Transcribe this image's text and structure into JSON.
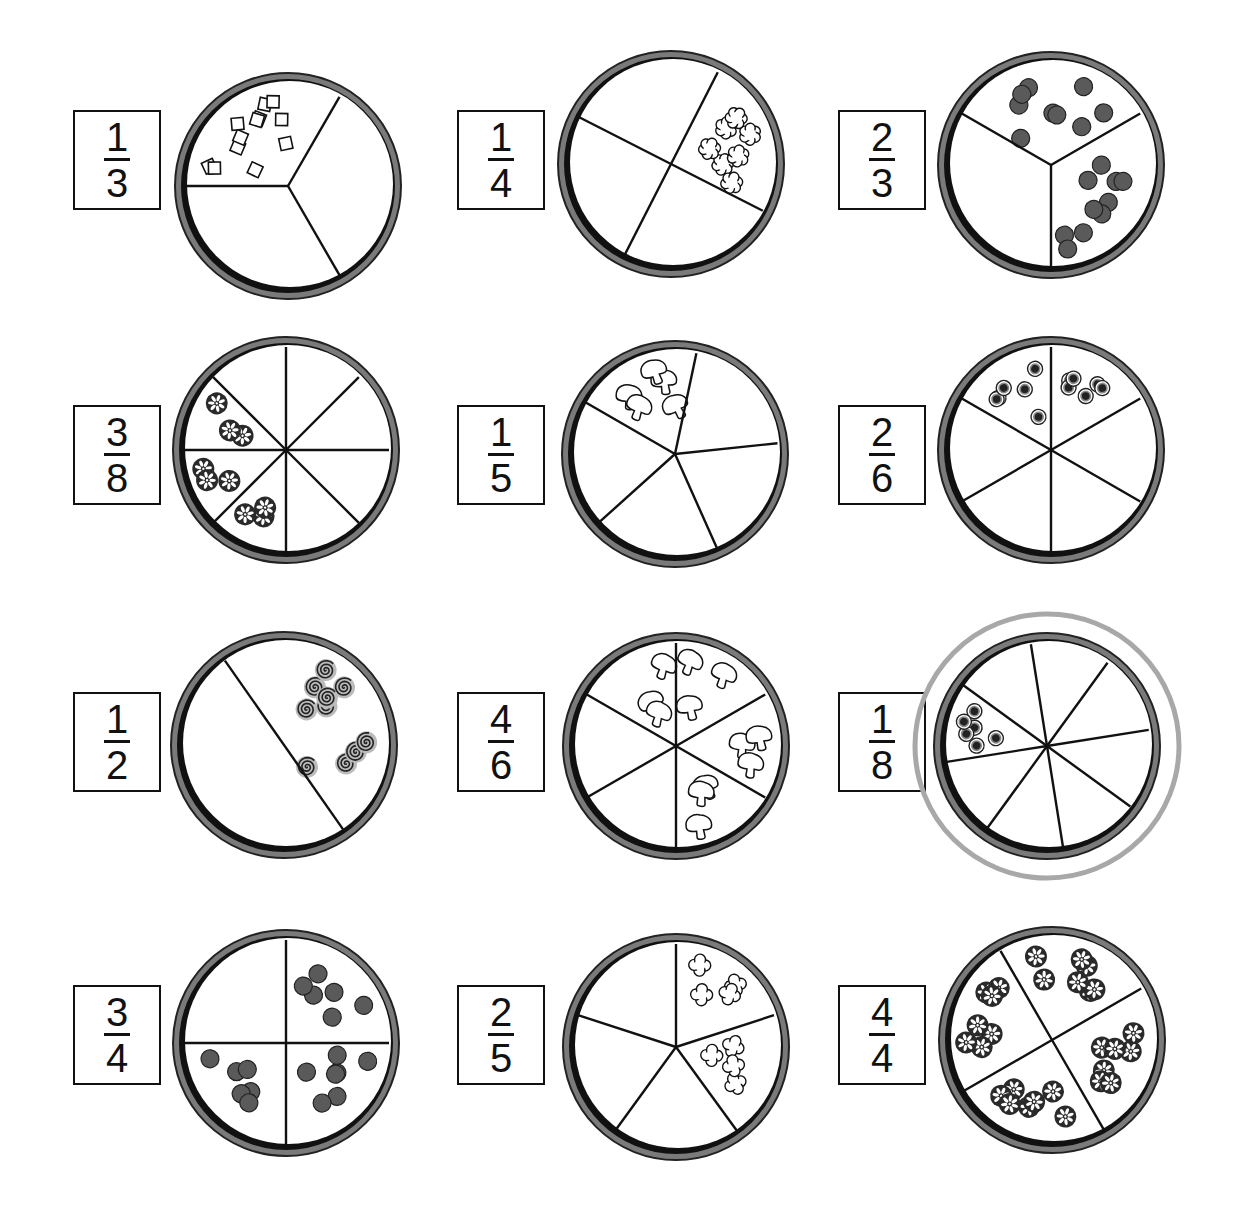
{
  "worksheet": {
    "grid": {
      "rows": 4,
      "cols": 3
    },
    "colors": {
      "crust_outer": "#7a7a7a",
      "crust_inner": "#111111",
      "line": "#111111",
      "topping_fill": "#5a5a5a",
      "highlight_ring": "#a8a8a8"
    },
    "items": [
      {
        "id": "p1",
        "numerator": "1",
        "denominator": "3",
        "slices": 3,
        "start_angle": 180,
        "topped": [
          0
        ],
        "topping": "square",
        "counts": [
          12
        ],
        "highlighted": false,
        "box": [
          73,
          110
        ],
        "center": [
          288,
          186
        ]
      },
      {
        "id": "p2",
        "numerator": "1",
        "denominator": "4",
        "slices": 4,
        "start_angle": -63,
        "topped": [
          0
        ],
        "topping": "cloud",
        "counts": [
          7
        ],
        "highlighted": false,
        "box": [
          457,
          110
        ],
        "center": [
          671,
          164
        ]
      },
      {
        "id": "p3",
        "numerator": "2",
        "denominator": "3",
        "slices": 3,
        "start_angle": -150,
        "topped": [
          0,
          1
        ],
        "topping": "dot",
        "counts": [
          9,
          10
        ],
        "highlighted": false,
        "box": [
          838,
          110
        ],
        "center": [
          1051,
          165
        ]
      },
      {
        "id": "p4",
        "numerator": "3",
        "denominator": "8",
        "slices": 8,
        "start_angle": -90,
        "topped": [
          4,
          5,
          6
        ],
        "topping": "pepper",
        "counts": [
          3,
          3,
          3
        ],
        "highlighted": false,
        "box": [
          73,
          405
        ],
        "center": [
          286,
          450
        ]
      },
      {
        "id": "p5",
        "numerator": "1",
        "denominator": "5",
        "slices": 5,
        "start_angle": -150,
        "topped": [
          0
        ],
        "topping": "mushroom",
        "counts": [
          5
        ],
        "highlighted": false,
        "box": [
          457,
          405
        ],
        "center": [
          675,
          454
        ]
      },
      {
        "id": "p6",
        "numerator": "2",
        "denominator": "6",
        "slices": 6,
        "start_angle": -150,
        "topped": [
          0,
          1
        ],
        "topping": "olive",
        "counts": [
          6,
          6
        ],
        "highlighted": false,
        "box": [
          838,
          405
        ],
        "center": [
          1051,
          450
        ]
      },
      {
        "id": "p7",
        "numerator": "1",
        "denominator": "2",
        "slices": 2,
        "start_angle": -125,
        "topped": [
          0
        ],
        "topping": "spiral",
        "counts": [
          10
        ],
        "highlighted": false,
        "box": [
          73,
          692
        ],
        "center": [
          284,
          745
        ]
      },
      {
        "id": "p8",
        "numerator": "4",
        "denominator": "6",
        "slices": 6,
        "start_angle": -150,
        "topped": [
          0,
          1,
          2,
          3
        ],
        "topping": "mushroom",
        "counts": [
          3,
          3,
          3,
          3
        ],
        "highlighted": false,
        "box": [
          457,
          692
        ],
        "center": [
          676,
          746
        ]
      },
      {
        "id": "p9",
        "numerator": "1",
        "denominator": "8",
        "slices": 8,
        "start_angle": -99,
        "topped": [
          6
        ],
        "topping": "olive",
        "counts": [
          6
        ],
        "highlighted": true,
        "box": [
          838,
          692
        ],
        "center": [
          1047,
          746
        ]
      },
      {
        "id": "p10",
        "numerator": "3",
        "denominator": "4",
        "slices": 4,
        "start_angle": -90,
        "topped": [
          0,
          1,
          2
        ],
        "topping": "dot",
        "counts": [
          6,
          7,
          6
        ],
        "highlighted": false,
        "box": [
          73,
          985
        ],
        "center": [
          286,
          1043
        ]
      },
      {
        "id": "p11",
        "numerator": "2",
        "denominator": "5",
        "slices": 5,
        "start_angle": -90,
        "topped": [
          0,
          1
        ],
        "topping": "flower",
        "counts": [
          4,
          4
        ],
        "highlighted": false,
        "box": [
          457,
          985
        ],
        "center": [
          676,
          1047
        ]
      },
      {
        "id": "p12",
        "numerator": "4",
        "denominator": "4",
        "slices": 4,
        "start_angle": -120,
        "topped": [
          0,
          1,
          2,
          3
        ],
        "topping": "pepper",
        "counts": [
          7,
          7,
          7,
          7
        ],
        "highlighted": false,
        "box": [
          838,
          985
        ],
        "center": [
          1052,
          1040
        ]
      }
    ]
  }
}
